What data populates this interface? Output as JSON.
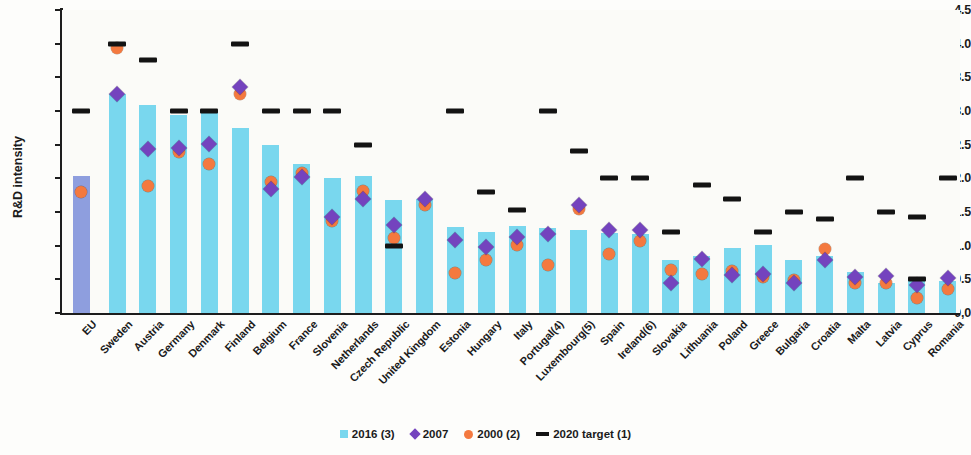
{
  "chart_data": {
    "type": "bar",
    "title": "",
    "xlabel": "",
    "ylabel": "R&D intensity",
    "ylim": [
      0.0,
      4.5
    ],
    "ytick_labels": [
      "0,0",
      "0.5",
      "1.0",
      "1.5",
      "2.0",
      "2.5",
      "3.0",
      "3.5",
      "4.0",
      "4.5"
    ],
    "ytick_values": [
      0.0,
      0.5,
      1.0,
      1.5,
      2.0,
      2.5,
      3.0,
      3.5,
      4.0,
      4.5
    ],
    "grid": false,
    "legend_position": "bottom-center",
    "categories": [
      "EU",
      "Sweden",
      "Austria",
      "Germany",
      "Denmark",
      "Finland",
      "Belgium",
      "France",
      "Slovenia",
      "Netherlands",
      "Czech Republic",
      "United Kingdom",
      "Estonia",
      "Hungary",
      "Italy",
      "Portugal(4)",
      "Luxembourg(5)",
      "Spain",
      "Ireland(6)",
      "Slovakia",
      "Lithuania",
      "Poland",
      "Greece",
      "Bulgaria",
      "Croatia",
      "Malta",
      "Latvia",
      "Cyprus",
      "Romania"
    ],
    "series": [
      {
        "name": "2016 (3)",
        "type": "bar",
        "color": "#79d7ee",
        "eu_color": "#8e9ede",
        "values": [
          2.03,
          3.25,
          3.09,
          2.94,
          3.01,
          2.75,
          2.49,
          2.22,
          2.0,
          2.03,
          1.68,
          1.69,
          1.28,
          1.21,
          1.29,
          1.27,
          1.24,
          1.19,
          1.18,
          0.79,
          0.85,
          0.97,
          1.01,
          0.78,
          0.85,
          0.61,
          0.44,
          0.5,
          0.48
        ]
      },
      {
        "name": "2007",
        "type": "scatter",
        "marker": "diamond",
        "color": "#7443be",
        "values": [
          null,
          3.26,
          2.43,
          2.45,
          2.51,
          3.35,
          1.84,
          2.02,
          1.42,
          1.7,
          1.31,
          1.69,
          1.08,
          0.98,
          1.13,
          1.17,
          1.61,
          1.23,
          1.24,
          0.45,
          0.8,
          0.56,
          0.58,
          0.44,
          0.79,
          0.54,
          0.55,
          0.41,
          0.52
        ]
      },
      {
        "name": "2000 (2)",
        "type": "scatter",
        "marker": "circle",
        "color": "#f4793f",
        "values": [
          1.79,
          3.93,
          1.89,
          2.39,
          2.22,
          3.25,
          1.94,
          2.08,
          1.36,
          1.81,
          1.12,
          1.61,
          0.6,
          0.78,
          1.01,
          0.71,
          1.54,
          0.87,
          1.07,
          0.64,
          0.58,
          0.62,
          0.53,
          0.49,
          0.95,
          0.45,
          0.44,
          0.22,
          0.35
        ]
      },
      {
        "name": "2020 target (1)",
        "type": "scatter",
        "marker": "dash",
        "color": "#131313",
        "values": [
          3.0,
          4.0,
          3.76,
          3.0,
          3.0,
          4.0,
          3.0,
          3.0,
          3.0,
          2.5,
          1.0,
          null,
          3.0,
          1.8,
          1.53,
          3.0,
          2.4,
          2.0,
          2.0,
          1.2,
          1.9,
          1.7,
          1.21,
          1.5,
          1.4,
          2.0,
          1.5,
          0.5,
          2.0
        ]
      }
    ],
    "secondary_targets": [
      {
        "category": "Cyprus",
        "value": 1.43
      }
    ]
  },
  "legend": {
    "items": [
      {
        "label": "2016 (3)",
        "swatch": "square-swatch-icon",
        "color": "#79d7ee"
      },
      {
        "label": "2007",
        "swatch": "diamond-swatch-icon",
        "color": "#7443be"
      },
      {
        "label": "2000 (2)",
        "swatch": "circle-swatch-icon",
        "color": "#f4793f"
      },
      {
        "label": "2020 target (1)",
        "swatch": "dash-swatch-icon",
        "color": "#131313"
      }
    ]
  }
}
